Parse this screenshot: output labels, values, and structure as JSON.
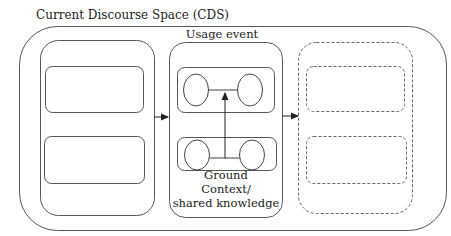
{
  "diagram": {
    "title": "Current Discourse Space (CDS)",
    "usage_event_label": "Usage event",
    "ground_label": "Ground",
    "context_label_line1": "Context/",
    "context_label_line2": "shared knowledge"
  },
  "colors": {
    "stroke": "#444444",
    "dashed_stroke": "#666666",
    "background": "#ffffff"
  }
}
